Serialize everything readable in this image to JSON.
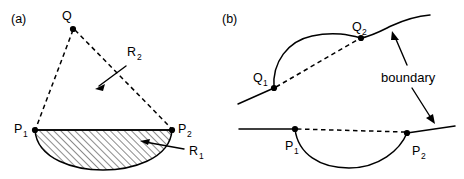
{
  "figure": {
    "background_color": "#ffffff",
    "line_color": "#000000",
    "width": 464,
    "height": 179,
    "panels": [
      {
        "id": "a",
        "label": "(a)",
        "points": [
          {
            "name": "Q",
            "base": "Q",
            "subscript": "",
            "x": 73,
            "y": 29
          },
          {
            "name": "P1",
            "base": "P",
            "subscript": "1",
            "x": 35,
            "y": 130
          },
          {
            "name": "P2",
            "base": "P",
            "subscript": "2",
            "x": 172,
            "y": 130
          }
        ],
        "regions": [
          {
            "name": "R1",
            "base": "R",
            "subscript": "1",
            "style": "hatched"
          },
          {
            "name": "R2",
            "base": "R",
            "subscript": "2",
            "style": "open"
          }
        ]
      },
      {
        "id": "b",
        "label": "(b)",
        "points": [
          {
            "name": "Q1",
            "base": "Q",
            "subscript": "1",
            "x": 274,
            "y": 88
          },
          {
            "name": "Q2",
            "base": "Q",
            "subscript": "2",
            "x": 361,
            "y": 38
          },
          {
            "name": "P1",
            "base": "P",
            "subscript": "1",
            "x": 295,
            "y": 129
          },
          {
            "name": "P2",
            "base": "P",
            "subscript": "2",
            "x": 407,
            "y": 133
          }
        ],
        "annotations": [
          {
            "name": "boundary",
            "text": "boundary",
            "arrows": 2
          }
        ]
      }
    ]
  },
  "labels": {
    "panel_a": "(a)",
    "panel_b": "(b)",
    "a_Q": "Q",
    "a_P": "P",
    "a_P1_sub": "1",
    "a_P2_sub": "2",
    "a_R": "R",
    "a_R1_sub": "1",
    "a_R2_sub": "2",
    "b_Q": "Q",
    "b_Q1_sub": "1",
    "b_Q2_sub": "2",
    "b_P": "P",
    "b_P1_sub": "1",
    "b_P2_sub": "2",
    "b_boundary": "boundary"
  }
}
